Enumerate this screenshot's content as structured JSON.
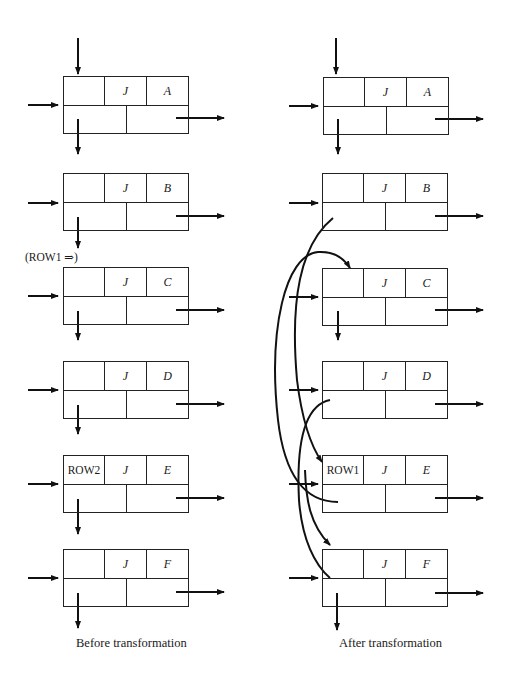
{
  "diagram": {
    "type": "sparse matrix orthogonal linked list row interchange",
    "left_panel": {
      "caption": "Before transformation",
      "nodes": [
        {
          "id": "A",
          "row_label": "",
          "col": "J",
          "value": "A"
        },
        {
          "id": "B",
          "row_label": "",
          "col": "J",
          "value": "B"
        },
        {
          "id": "C",
          "row_label": "",
          "col": "J",
          "value": "C"
        },
        {
          "id": "D",
          "row_label": "",
          "col": "J",
          "value": "D"
        },
        {
          "id": "E",
          "row_label": "ROW2",
          "col": "J",
          "value": "E"
        },
        {
          "id": "F",
          "row_label": "",
          "col": "J",
          "value": "F"
        }
      ],
      "annotation": "(ROW1 ⇒)"
    },
    "right_panel": {
      "caption": "After transformation",
      "nodes": [
        {
          "id": "A",
          "row_label": "",
          "col": "J",
          "value": "A"
        },
        {
          "id": "B",
          "row_label": "",
          "col": "J",
          "value": "B"
        },
        {
          "id": "C",
          "row_label": "",
          "col": "J",
          "value": "C"
        },
        {
          "id": "D",
          "row_label": "",
          "col": "J",
          "value": "D"
        },
        {
          "id": "E",
          "row_label": "ROW1",
          "col": "J",
          "value": "E"
        },
        {
          "id": "F",
          "row_label": "",
          "col": "J",
          "value": "F"
        }
      ],
      "relinks": [
        {
          "from": "B.down",
          "to": "E"
        },
        {
          "from": "D.down",
          "to": "C"
        },
        {
          "from": "E.down",
          "to": "F"
        }
      ]
    }
  }
}
